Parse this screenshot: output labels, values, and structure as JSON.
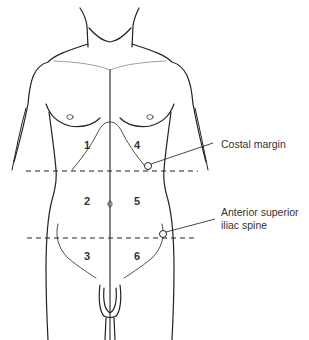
{
  "diagram": {
    "regions": [
      {
        "id": "1",
        "label": "1",
        "x": 84,
        "y": 149
      },
      {
        "id": "2",
        "label": "2",
        "x": 84,
        "y": 205
      },
      {
        "id": "3",
        "label": "3",
        "x": 84,
        "y": 260
      },
      {
        "id": "4",
        "label": "4",
        "x": 137,
        "y": 149
      },
      {
        "id": "5",
        "label": "5",
        "x": 137,
        "y": 205
      },
      {
        "id": "6",
        "label": "6",
        "x": 137,
        "y": 260
      }
    ],
    "annotations": [
      {
        "id": "costal-margin",
        "text": "Costal margin"
      },
      {
        "id": "asis-line1",
        "text": "Anterior superior"
      },
      {
        "id": "asis-line2",
        "text": "iliac spine"
      }
    ],
    "colors": {
      "line": "#222222",
      "text": "#333333",
      "background": "#ffffff"
    }
  }
}
